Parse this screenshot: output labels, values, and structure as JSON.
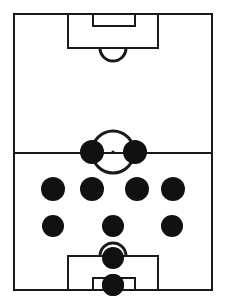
{
  "diagram": {
    "kind": "football-pitch-formation",
    "orientation": "vertical",
    "formation_label": "4-4-2",
    "line_color": "#1a1a1a",
    "fill_color": "#ffffff",
    "player_color": "#111111",
    "line_width": 2,
    "canvas": {
      "width": 225,
      "height": 305
    }
  },
  "pitch": {
    "boundary": {
      "x": 14,
      "y": 14,
      "width": 198,
      "height": 276
    },
    "halfway_line": {
      "y": 153,
      "x1": 14,
      "x2": 212
    },
    "center_circle": {
      "cx": 113,
      "cy": 152,
      "r": 21
    },
    "center_mark": {
      "cx": 113,
      "cy": 152,
      "r": 1.6
    },
    "top_penalty_area": {
      "x": 68,
      "y": 14,
      "width": 90,
      "height": 34
    },
    "top_goal_area": {
      "x": 93,
      "y": 14,
      "width": 42,
      "height": 12
    },
    "top_penalty_arc": {
      "cx": 113,
      "cy": 48,
      "r": 13,
      "start_deg": 0,
      "end_deg": 180
    },
    "bottom_penalty_area": {
      "x": 68,
      "y": 256,
      "width": 90,
      "height": 34
    },
    "bottom_goal_area": {
      "x": 93,
      "y": 278,
      "width": 42,
      "height": 12
    },
    "bottom_penalty_arc": {
      "cx": 113,
      "cy": 256,
      "r": 13,
      "start_deg": 180,
      "end_deg": 360
    }
  },
  "players": [
    {
      "id": "p1",
      "label": "goalkeeper",
      "x": 113,
      "y": 285,
      "r": 11
    },
    {
      "id": "p2",
      "label": "centre-back",
      "x": 113,
      "y": 258,
      "r": 11
    },
    {
      "id": "p3",
      "label": "left-back",
      "x": 53,
      "y": 226,
      "r": 11
    },
    {
      "id": "p4",
      "label": "centre-mid",
      "x": 113,
      "y": 226,
      "r": 11
    },
    {
      "id": "p5",
      "label": "right-back",
      "x": 172,
      "y": 226,
      "r": 11
    },
    {
      "id": "p6",
      "label": "left-mid",
      "x": 53,
      "y": 189,
      "r": 12
    },
    {
      "id": "p7",
      "label": "left-centre-mid",
      "x": 92,
      "y": 189,
      "r": 12
    },
    {
      "id": "p8",
      "label": "right-centre-mid",
      "x": 137,
      "y": 189,
      "r": 12
    },
    {
      "id": "p9",
      "label": "right-mid",
      "x": 173,
      "y": 189,
      "r": 12
    },
    {
      "id": "p10",
      "label": "left-striker",
      "x": 92,
      "y": 152,
      "r": 12
    },
    {
      "id": "p11",
      "label": "right-striker",
      "x": 135,
      "y": 152,
      "r": 12
    }
  ]
}
